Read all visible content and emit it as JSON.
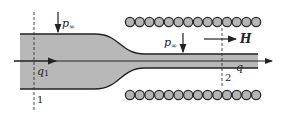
{
  "diagram": {
    "colors": {
      "fluid": "#b8b8b8",
      "outline": "#222222",
      "coil_fill": "#b5b5b5",
      "coil_stroke": "#2a2a2a",
      "background": "#ffffff"
    },
    "labels": {
      "pressure_left": "p",
      "pressure_left_sub": "∞",
      "pressure_right": "p",
      "pressure_right_sub": "∞",
      "field": "H",
      "flow_in": "q",
      "flow_in_sub": "1",
      "flow_out": "q",
      "section_1": "1",
      "section_2": "2"
    },
    "coil_turns_per_row": 14
  }
}
